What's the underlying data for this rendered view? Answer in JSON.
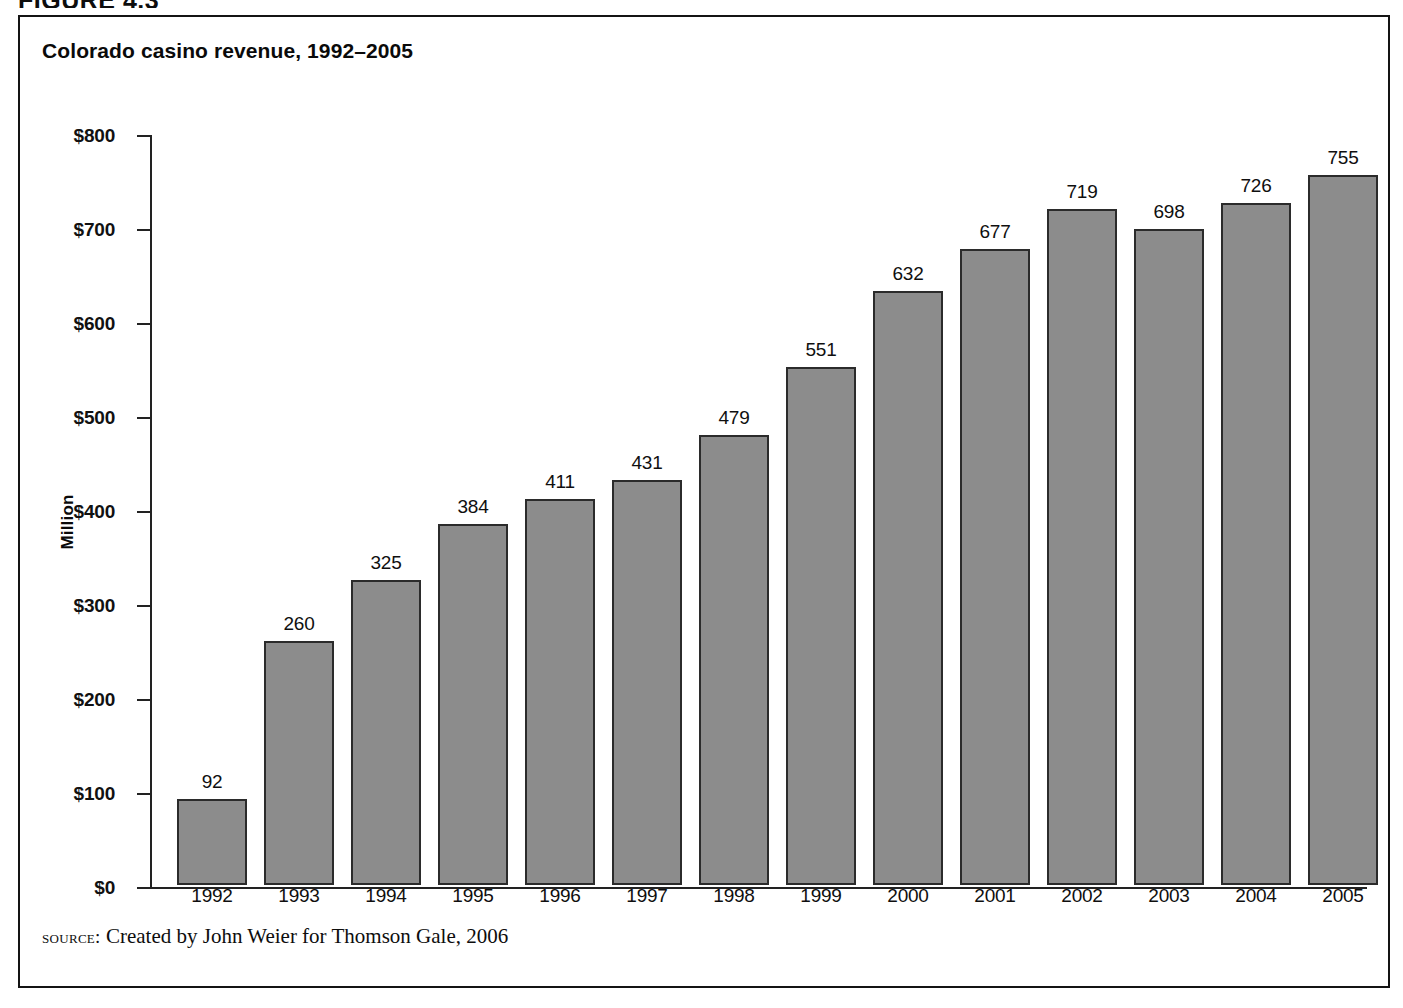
{
  "figure": {
    "caption": "FIGURE 4.3",
    "source_label": "source:",
    "source_text": "Created by John Weier for Thomson Gale, 2006"
  },
  "colors": {
    "bar_fill": "#8c8c8c",
    "bar_stroke": "#2b2b2b",
    "axis": "#222222",
    "text": "#0f0f0f",
    "frame": "#141414",
    "background": "#ffffff"
  },
  "chart_data": {
    "type": "bar",
    "title": "Colorado casino revenue, 1992–2005",
    "xlabel": "",
    "ylabel": "Million",
    "categories": [
      "1992",
      "1993",
      "1994",
      "1995",
      "1996",
      "1997",
      "1998",
      "1999",
      "2000",
      "2001",
      "2002",
      "2003",
      "2004",
      "2005"
    ],
    "values": [
      92,
      260,
      325,
      384,
      411,
      431,
      479,
      551,
      632,
      677,
      719,
      698,
      726,
      755
    ],
    "value_labels": [
      "92",
      "260",
      "325",
      "384",
      "411",
      "431",
      "479",
      "551",
      "632",
      "677",
      "719",
      "698",
      "726",
      "755"
    ],
    "ylim": [
      0,
      800
    ],
    "ytick_values": [
      0,
      100,
      200,
      300,
      400,
      500,
      600,
      700,
      800
    ],
    "ytick_labels": [
      "$0",
      "$100",
      "$200",
      "$300",
      "$400",
      "$500",
      "$600",
      "$700",
      "$800"
    ],
    "grid": false,
    "legend": false,
    "data_labels": true,
    "units": "Million US dollars"
  }
}
